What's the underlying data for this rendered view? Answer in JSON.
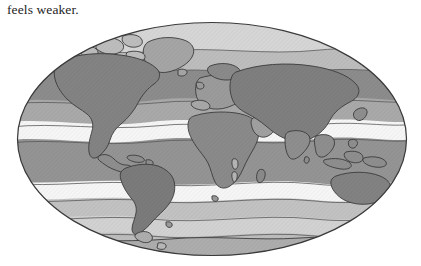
{
  "page": {
    "background_color": "#ffffff",
    "width": 421,
    "height": 266
  },
  "caption": {
    "text": "feels weaker."
  },
  "figure": {
    "name": "world-climate-zone-map",
    "projection": "Mollweide elliptical world projection",
    "ellipse": {
      "center_x": 212,
      "center_y": 139,
      "radius_x": 195,
      "radius_y": 117,
      "outline_color": "#3a3a3a",
      "outline_width": 1.1
    },
    "colors": {
      "polar_light": "#d4d4d4",
      "subpolar_mid": "#b9b9b9",
      "boreal_dark": "#8a8a8a",
      "temperate_mid": "#a8a8a8",
      "subtropical_white": "#f4f4f4",
      "tropical_mid": "#9c9c9c",
      "equatorial_dark": "#8f8f8f",
      "land_dark": "#767676",
      "land_mid": "#8f8f8f",
      "land_light": "#b0b0b0",
      "land_outline": "#3c3c3c",
      "antarctica": "#c6c6c6",
      "white_band": "#f6f6f6"
    },
    "bands": [
      {
        "name": "north-polar-light",
        "label": "Polar",
        "fill": "#d6d6d6"
      },
      {
        "name": "north-boreal-dark",
        "label": "Subarctic",
        "fill": "#8c8c8c"
      },
      {
        "name": "north-temperate-mid",
        "label": "Temperate",
        "fill": "#a9a9a9"
      },
      {
        "name": "north-subtropical-white",
        "label": "Subtropical high",
        "fill": "#f6f6f6"
      },
      {
        "name": "tropical-mid",
        "label": "Tropical",
        "fill": "#949494"
      },
      {
        "name": "south-subtropical-white",
        "label": "Subtropical high",
        "fill": "#f6f6f6"
      },
      {
        "name": "south-temperate-light",
        "label": "Temperate",
        "fill": "#c0c0c0"
      },
      {
        "name": "south-subpolar-light",
        "label": "Subpolar",
        "fill": "#d0d0d0"
      },
      {
        "name": "antarctic-band",
        "label": "Antarctic",
        "fill": "#bdbdbd"
      }
    ],
    "landmasses": [
      {
        "name": "greenland",
        "label": "Greenland"
      },
      {
        "name": "north-america",
        "label": "North America"
      },
      {
        "name": "south-america",
        "label": "South America"
      },
      {
        "name": "europe",
        "label": "Europe"
      },
      {
        "name": "africa",
        "label": "Africa"
      },
      {
        "name": "asia",
        "label": "Asia"
      },
      {
        "name": "australia",
        "label": "Australia"
      },
      {
        "name": "antarctica",
        "label": "Antarctica"
      }
    ]
  }
}
